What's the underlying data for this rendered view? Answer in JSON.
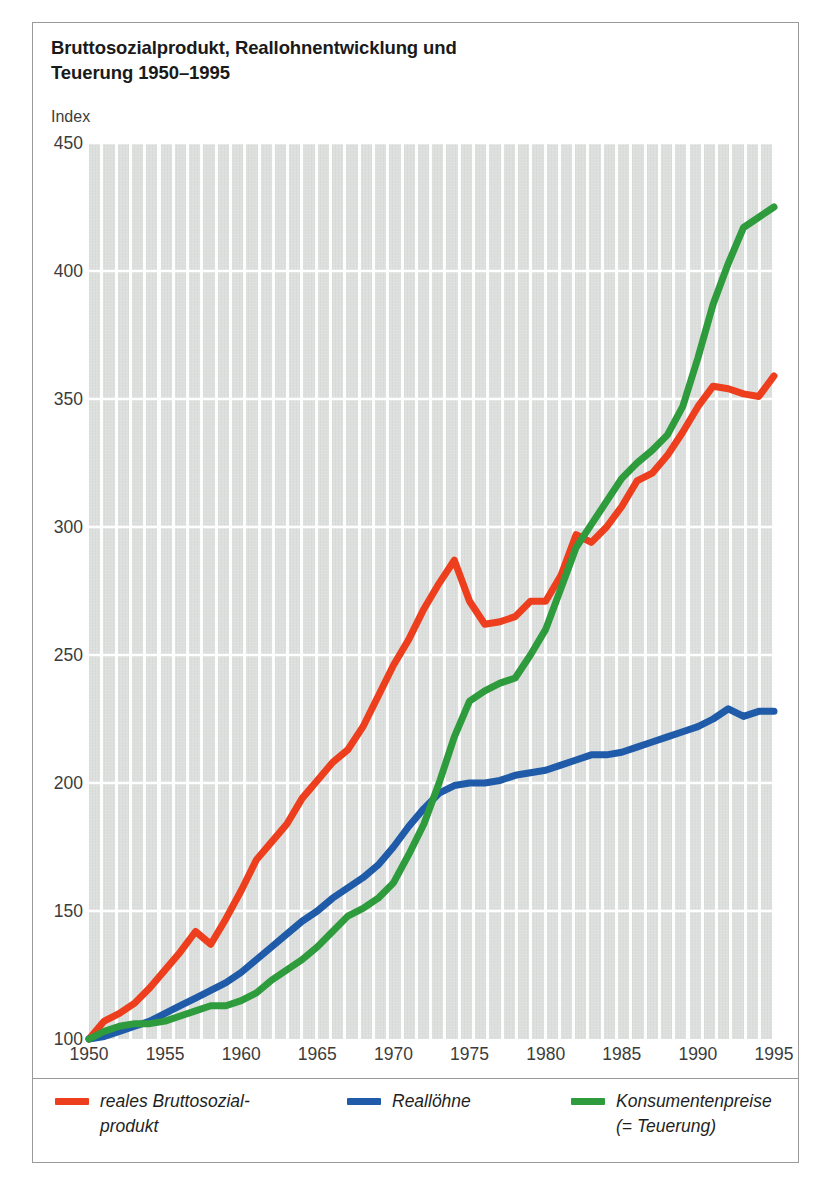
{
  "title": {
    "line1": "Bruttosozialprodukt, Reallohnentwicklung und",
    "line2": "Teuerung 1950–1995"
  },
  "axis": {
    "unit_label": "Index",
    "y_ticks": [
      "450",
      "400",
      "350",
      "300",
      "250",
      "200",
      "150",
      "100"
    ],
    "x_ticks": [
      "1950",
      "1955",
      "1960",
      "1965",
      "1970",
      "1975",
      "1980",
      "1985",
      "1990",
      "1995"
    ]
  },
  "legend": {
    "items": [
      {
        "label": "reales Bruttosozial-\nprodukt",
        "color": "#ED3E1E"
      },
      {
        "label": "Reallöhne",
        "color": "#1F5BA8"
      },
      {
        "label": "Konsumentenpreise\n(= Teuerung)",
        "color": "#2E9B3C"
      }
    ]
  },
  "colors": {
    "red": "#ED3E1E",
    "blue": "#1F5BA8",
    "green": "#2E9B3C",
    "plot_background": "#dcdfdd",
    "gridline": "#ffffff",
    "frame": "#9a9a9a",
    "text": "#1f1f1f"
  },
  "chart_data": {
    "type": "line",
    "title": "Bruttosozialprodukt, Reallohnentwicklung und Teuerung 1950–1995",
    "xlabel": "",
    "ylabel": "Index",
    "xlim": [
      1950,
      1995
    ],
    "ylim": [
      100,
      450
    ],
    "grid": true,
    "legend_position": "bottom",
    "x": [
      1950,
      1951,
      1952,
      1953,
      1954,
      1955,
      1956,
      1957,
      1958,
      1959,
      1960,
      1961,
      1962,
      1963,
      1964,
      1965,
      1966,
      1967,
      1968,
      1969,
      1970,
      1971,
      1972,
      1973,
      1974,
      1975,
      1976,
      1977,
      1978,
      1979,
      1980,
      1981,
      1982,
      1983,
      1984,
      1985,
      1986,
      1987,
      1988,
      1989,
      1990,
      1991,
      1992,
      1993,
      1994,
      1995
    ],
    "series": [
      {
        "name": "reales Bruttosozialprodukt",
        "color": "#ED3E1E",
        "values": [
          100,
          107,
          110,
          114,
          120,
          127,
          134,
          142,
          137,
          147,
          158,
          170,
          177,
          184,
          194,
          201,
          208,
          213,
          222,
          234,
          246,
          256,
          268,
          278,
          287,
          271,
          262,
          263,
          265,
          271,
          271,
          281,
          297,
          294,
          300,
          308,
          318,
          321,
          328,
          337,
          347,
          355,
          354,
          352,
          351,
          359
        ]
      },
      {
        "name": "Reallöhne",
        "color": "#1F5BA8",
        "values": [
          100,
          101,
          103,
          105,
          107,
          110,
          113,
          116,
          119,
          122,
          126,
          131,
          136,
          141,
          146,
          150,
          155,
          159,
          163,
          168,
          175,
          183,
          190,
          196,
          199,
          200,
          200,
          201,
          203,
          204,
          205,
          207,
          209,
          211,
          211,
          212,
          214,
          216,
          218,
          220,
          222,
          225,
          229,
          226,
          228,
          228
        ]
      },
      {
        "name": "Konsumentenpreise (= Teuerung)",
        "color": "#2E9B3C",
        "values": [
          100,
          103,
          105,
          106,
          106,
          107,
          109,
          111,
          113,
          113,
          115,
          118,
          123,
          127,
          131,
          136,
          142,
          148,
          151,
          155,
          161,
          172,
          184,
          200,
          218,
          232,
          236,
          239,
          241,
          250,
          260,
          276,
          292,
          301,
          310,
          319,
          325,
          330,
          336,
          347,
          366,
          387,
          403,
          417,
          421,
          425
        ]
      }
    ]
  }
}
